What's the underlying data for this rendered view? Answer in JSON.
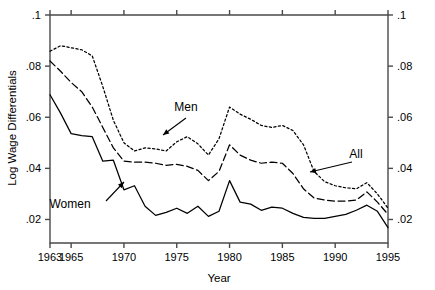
{
  "chart_data": {
    "type": "line",
    "title": "",
    "xlabel": "Year",
    "ylabel": "Log Wage Differentials",
    "xlim": [
      1963,
      1995
    ],
    "ylim": [
      0.0108,
      0.1
    ],
    "xticks": [
      1963,
      1965,
      1970,
      1975,
      1980,
      1985,
      1990,
      1995
    ],
    "xticklabels": [
      "1963",
      "1965",
      "1970",
      "1975",
      "1980",
      "1985",
      "1990",
      "1995"
    ],
    "yticks": [
      0.02,
      0.04,
      0.06,
      0.08,
      0.1
    ],
    "yticklabels": [
      ".02",
      ".04",
      ".06",
      ".08",
      ".1"
    ],
    "right_axis": true,
    "right_yticklabels": [
      ".02",
      ".04",
      ".06",
      ".08",
      ".1"
    ],
    "grid": false,
    "legend": "annotations-on-plot",
    "x": [
      1963,
      1964,
      1965,
      1966,
      1967,
      1968,
      1969,
      1970,
      1971,
      1972,
      1973,
      1974,
      1975,
      1976,
      1977,
      1978,
      1979,
      1980,
      1981,
      1982,
      1983,
      1984,
      1985,
      1986,
      1987,
      1988,
      1989,
      1990,
      1991,
      1992,
      1993,
      1994,
      1995
    ],
    "series": [
      {
        "name": "Men",
        "style": "dotted",
        "values": [
          0.0858,
          0.088,
          0.0872,
          0.0864,
          0.084,
          0.072,
          0.0588,
          0.05,
          0.0468,
          0.048,
          0.0476,
          0.0468,
          0.0504,
          0.0524,
          0.0496,
          0.0452,
          0.0516,
          0.064,
          0.0612,
          0.0592,
          0.0568,
          0.056,
          0.0568,
          0.0548,
          0.0492,
          0.0388,
          0.0348,
          0.0332,
          0.0324,
          0.032,
          0.0344,
          0.03,
          0.0244
        ]
      },
      {
        "name": "All",
        "style": "dashed",
        "values": [
          0.082,
          0.078,
          0.0736,
          0.07,
          0.064,
          0.056,
          0.048,
          0.0428,
          0.0424,
          0.0424,
          0.042,
          0.0412,
          0.0416,
          0.0408,
          0.0392,
          0.0352,
          0.0388,
          0.0492,
          0.0452,
          0.0432,
          0.042,
          0.0424,
          0.042,
          0.038,
          0.032,
          0.0284,
          0.0276,
          0.0272,
          0.0272,
          0.0276,
          0.0308,
          0.0268,
          0.022
        ]
      },
      {
        "name": "Women",
        "style": "solid",
        "values": [
          0.0688,
          0.0616,
          0.0536,
          0.0528,
          0.0524,
          0.0428,
          0.0432,
          0.0316,
          0.0332,
          0.0252,
          0.0216,
          0.0228,
          0.0244,
          0.0224,
          0.0252,
          0.0212,
          0.0232,
          0.0352,
          0.0268,
          0.026,
          0.0236,
          0.0248,
          0.0244,
          0.0224,
          0.0208,
          0.0204,
          0.0204,
          0.0212,
          0.022,
          0.0236,
          0.0256,
          0.0232,
          0.0168
        ]
      }
    ],
    "annotations": [
      {
        "label": "Men",
        "text_x": 186,
        "text_y": 111,
        "arrow_from_x": 186,
        "arrow_from_y": 118,
        "arrow_to_x": 163,
        "arrow_to_y": 135
      },
      {
        "label": "All",
        "text_x": 356,
        "text_y": 158,
        "arrow_from_x": 352,
        "arrow_from_y": 162,
        "arrow_to_x": 310,
        "arrow_to_y": 172
      },
      {
        "label": "Women",
        "text_x": 70,
        "text_y": 208,
        "arrow_from_x": 106,
        "arrow_from_y": 201,
        "arrow_to_x": 124,
        "arrow_to_y": 182
      }
    ]
  },
  "axis": {
    "y_title": "Log Wage Differentials",
    "x_title": "Year"
  },
  "colors": {
    "axis": "#4a4a4a",
    "series": "#000000",
    "background": "#ffffff"
  }
}
